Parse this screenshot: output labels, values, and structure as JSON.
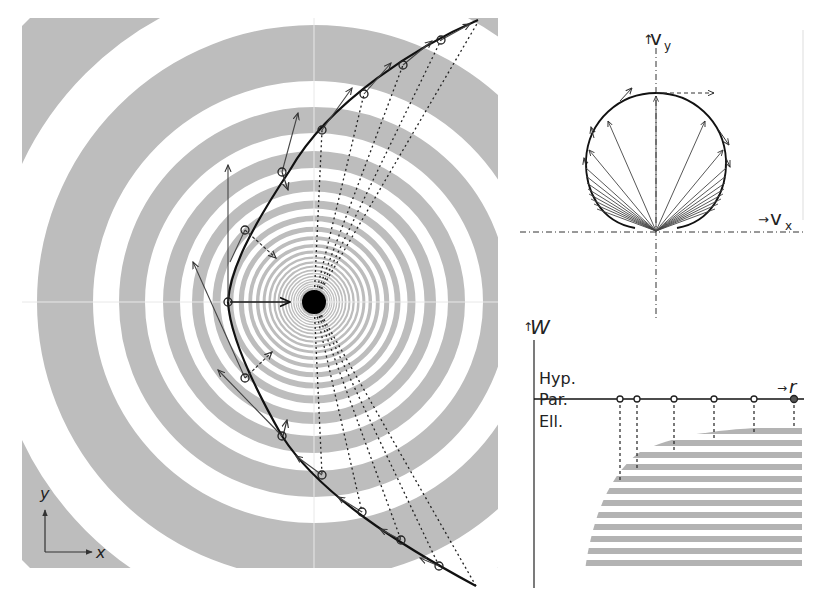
{
  "figure": {
    "panels": {
      "orbit": {
        "description": "Hyperbolic orbit around a central mass with concentric gravitational potential rings",
        "axis_x_label": "x",
        "axis_y_label": "y",
        "central_body": "sun",
        "ring_color": "#bdbdbd",
        "orbit_color": "#111111"
      },
      "hodograph": {
        "description": "Velocity hodograph (circle) with velocity vectors",
        "axis_x_label": "v",
        "axis_x_sub": "x",
        "axis_y_label": "v",
        "axis_y_sub": "y",
        "arrow_up": "↑",
        "arrow_right": "→"
      },
      "energy": {
        "description": "Energy W versus radius r; hatched region = elliptical (bound) orbits",
        "axis_y_label": "W",
        "axis_y_arrow": "↑",
        "axis_x_label": "r",
        "axis_x_arrow": "→",
        "zones": [
          "Hyp.",
          "Par.",
          "Ell."
        ],
        "sample_points": 6,
        "hatch_color": "#b3b3b3"
      }
    }
  }
}
